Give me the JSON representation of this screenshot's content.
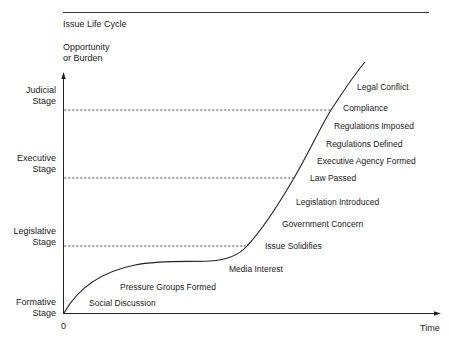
{
  "diagram": {
    "title": "Issue Life Cycle",
    "y_axis_label_line1": "Opportunity",
    "y_axis_label_line2": "or Burden",
    "x_axis_label": "Time",
    "origin_label": "0",
    "stages": [
      {
        "line1": "Judicial",
        "line2": "Stage"
      },
      {
        "line1": "Executive",
        "line2": "Stage"
      },
      {
        "line1": "Legislative",
        "line2": "Stage"
      },
      {
        "line1": "Formative",
        "line2": "Stage"
      }
    ],
    "events": [
      "Social Discussion",
      "Pressure Groups Formed",
      "Media Interest",
      "Issue Solidifies",
      "Government Concern",
      "Legislation Introduced",
      "Law Passed",
      "Executive Agency Formed",
      "Regulations Defined",
      "Regulations Imposed",
      "Compliance",
      "Legal Conflict"
    ],
    "colors": {
      "line": "#222222",
      "background": "#ffffff"
    }
  }
}
